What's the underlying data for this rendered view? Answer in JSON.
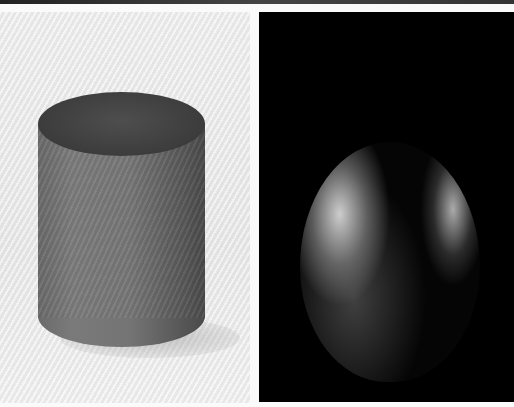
{
  "image": {
    "left_panel": {
      "subject": "wooden cylinder",
      "background": "light gray",
      "colors": {
        "background": "#e8e8e8",
        "object_top": "#3e3e3e",
        "object_side": "#737373"
      }
    },
    "right_panel": {
      "subject": "wooden egg shape lit from sides",
      "background": "black",
      "colors": {
        "background": "#000000",
        "highlight": "#d4d4d4"
      }
    }
  }
}
